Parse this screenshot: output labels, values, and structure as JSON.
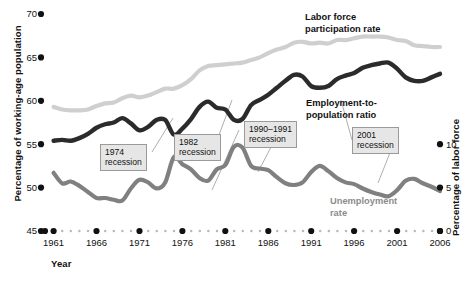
{
  "axes": {
    "y_left_title": "Percentage of working-age population",
    "y_right_title": "Percentage of labor force",
    "x_title": "Year",
    "y_left_ticks": [
      "45",
      "50",
      "55",
      "60",
      "65",
      "70"
    ],
    "y_right_ticks": [
      "0",
      "5",
      "10"
    ],
    "x_ticks": [
      "1961",
      "1966",
      "1971",
      "1976",
      "1981",
      "1986",
      "1991",
      "1996",
      "2001",
      "2006"
    ]
  },
  "series_labels": {
    "lfpr": "Labor force\nparticipation rate",
    "epop": "Employment-to-\npopulation ratio",
    "unemployment": "Unemployment\nrate"
  },
  "annotations": [
    {
      "id": "rec-1974",
      "text": "1974\nrecession"
    },
    {
      "id": "rec-1982",
      "text": "1982\nrecession"
    },
    {
      "id": "rec-1990",
      "text": "1990–1991\nrecession"
    },
    {
      "id": "rec-2001",
      "text": "2001\nrecession"
    }
  ],
  "colors": {
    "lfpr": "#cfcfcf",
    "epop": "#2b2b2b",
    "unemployment": "#808080",
    "axis": "#111111",
    "guide_dot": "#b8b8b8",
    "box_fill": "#e6e6e6",
    "box_border": "#9a9a9a"
  },
  "chart_data": {
    "type": "line",
    "title": "",
    "xlabel": "Year",
    "ylabel": "Percentage of working-age population",
    "ylabel_right": "Percentage of labor force",
    "xlim": [
      1960,
      2006
    ],
    "ylim": [
      45,
      70
    ],
    "ylim_right": [
      0,
      10
    ],
    "grid": false,
    "legend": "inline-labels",
    "x": [
      1961,
      1962,
      1963,
      1964,
      1965,
      1966,
      1967,
      1968,
      1969,
      1970,
      1971,
      1972,
      1973,
      1974,
      1975,
      1976,
      1977,
      1978,
      1979,
      1980,
      1981,
      1982,
      1983,
      1984,
      1985,
      1986,
      1987,
      1988,
      1989,
      1990,
      1991,
      1992,
      1993,
      1994,
      1995,
      1996,
      1997,
      1998,
      1999,
      2000,
      2001,
      2002,
      2003,
      2004,
      2005,
      2006
    ],
    "series": [
      {
        "name": "Labor force participation rate",
        "axis": "left",
        "color": "#cfcfcf",
        "values": [
          59.3,
          59.0,
          58.9,
          58.9,
          59.0,
          59.4,
          59.7,
          59.8,
          60.3,
          60.6,
          60.4,
          60.6,
          61.0,
          61.4,
          61.4,
          61.8,
          62.5,
          63.5,
          64.0,
          64.1,
          64.2,
          64.3,
          64.4,
          64.7,
          65.0,
          65.5,
          65.9,
          66.2,
          66.7,
          66.8,
          66.6,
          66.7,
          66.6,
          67.0,
          67.0,
          67.2,
          67.4,
          67.4,
          67.4,
          67.3,
          67.0,
          66.9,
          66.4,
          66.3,
          66.2,
          66.2
        ]
      },
      {
        "name": "Employment-to-population ratio",
        "axis": "left",
        "color": "#2b2b2b",
        "values": [
          55.4,
          55.5,
          55.4,
          55.7,
          56.2,
          56.9,
          57.3,
          57.5,
          58.0,
          57.4,
          56.6,
          57.0,
          57.8,
          57.8,
          56.1,
          56.8,
          57.9,
          59.3,
          59.9,
          59.2,
          59.0,
          57.8,
          57.9,
          59.5,
          60.1,
          60.7,
          61.5,
          62.3,
          63.0,
          62.8,
          61.7,
          61.5,
          61.7,
          62.5,
          62.9,
          63.2,
          63.8,
          64.1,
          64.3,
          64.4,
          63.7,
          62.7,
          62.3,
          62.3,
          62.7,
          63.1
        ]
      },
      {
        "name": "Unemployment rate",
        "axis": "right",
        "color": "#808080",
        "values": [
          6.7,
          5.5,
          5.7,
          5.2,
          4.5,
          3.8,
          3.8,
          3.6,
          3.5,
          4.9,
          5.9,
          5.6,
          4.9,
          5.6,
          8.5,
          7.7,
          7.1,
          6.1,
          5.8,
          7.1,
          7.6,
          9.7,
          9.6,
          7.5,
          7.2,
          7.0,
          6.2,
          5.5,
          5.3,
          5.6,
          6.8,
          7.5,
          6.9,
          6.1,
          5.6,
          5.4,
          4.9,
          4.5,
          4.2,
          4.0,
          4.7,
          5.8,
          6.0,
          5.5,
          5.1,
          4.6
        ]
      }
    ]
  }
}
